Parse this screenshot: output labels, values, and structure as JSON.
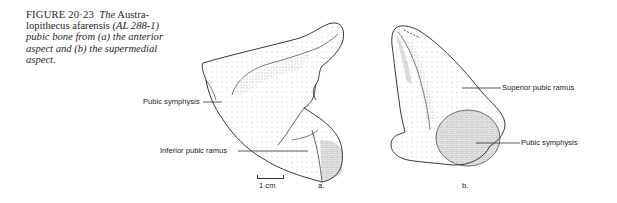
{
  "figure": {
    "number_label": "FIGURE 20·23",
    "caption_parts": [
      {
        "text": "The",
        "italic": true
      },
      {
        "text": " Austra-lopithecus afarensis ",
        "italic": false
      },
      {
        "text": "(AL 288-1) pubic bone from (a) the anterior aspect and (b) the supermedial aspect.",
        "italic": true
      }
    ],
    "caption_lines": [
      "FIGURE 20·23  The Austra-",
      "lopithecus afarensis (AL 288-1)",
      "pubic bone from (a) the anterior",
      "aspect and (b) the supermedial",
      "aspect."
    ]
  },
  "panel_a": {
    "subfigure_label": "a.",
    "labels": {
      "pubic_symphysis": "Pubic symphysis",
      "inferior_pubic_ramus": "Inferior pubic ramus"
    },
    "scale_bar": "1 cm"
  },
  "panel_b": {
    "subfigure_label": "b.",
    "labels": {
      "superior_pubic_ramus": "Superior pubic ramus",
      "pubic_symphysis": "Pubic symphysis"
    }
  },
  "colors": {
    "ink": "#222222",
    "stipple": "#555555",
    "paper": "#ffffff"
  }
}
